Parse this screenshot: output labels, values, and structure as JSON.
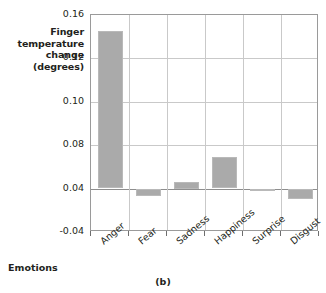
{
  "chart_data": {
    "type": "bar",
    "title": "",
    "caption": "(b)",
    "xlabel": "Emotions",
    "ylabel_lines": [
      "Finger",
      "temperature",
      "change",
      "(degrees)"
    ],
    "ylabel": "Finger temperature change (degrees)",
    "categories": [
      "Anger",
      "Fear",
      "Sadness",
      "Happiness",
      "Surprise",
      "Disgust"
    ],
    "values": [
      0.145,
      0.027,
      0.046,
      0.069,
      0.036,
      0.022
    ],
    "baseline": 0.04,
    "ytick_labels": [
      "0.16",
      "0.12",
      "0.10",
      "0.08",
      "0.04",
      "-0.04"
    ],
    "ytick_values": [
      0.16,
      0.12,
      0.1,
      0.08,
      0.04,
      -0.04
    ],
    "ylim": [
      -0.04,
      0.16
    ],
    "grid": true,
    "legend": "none",
    "bar_color": "#aaaaaa",
    "grid_color": "#c9c9c9",
    "axis_color": "#9a9a9a"
  }
}
